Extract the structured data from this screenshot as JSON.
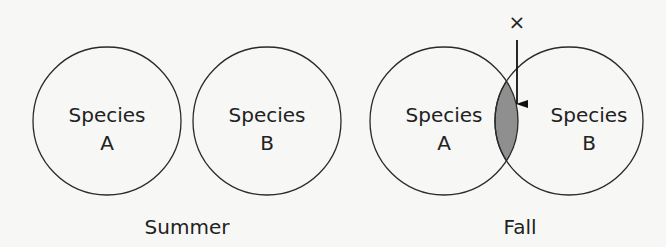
{
  "diagram": {
    "type": "venn-comparison",
    "colors": {
      "background": "#f7f7f5",
      "stroke": "#2a2a2a",
      "overlap_fill": "#8f8f8f",
      "text": "#222222"
    },
    "panels": [
      {
        "caption": "Summer",
        "circles": [
          {
            "line1": "Species",
            "line2": "A",
            "cx": 107,
            "cy": 121,
            "r": 74
          },
          {
            "line1": "Species",
            "line2": "B",
            "cx": 267,
            "cy": 121,
            "r": 74
          }
        ],
        "overlap": false
      },
      {
        "caption": "Fall",
        "circles": [
          {
            "line1": "Species",
            "line2": "A",
            "cx": 444,
            "cy": 121,
            "r": 74
          },
          {
            "line1": "Species",
            "line2": "B",
            "cx": 569,
            "cy": 121,
            "r": 74
          }
        ],
        "overlap": true,
        "marker": "×"
      }
    ]
  }
}
